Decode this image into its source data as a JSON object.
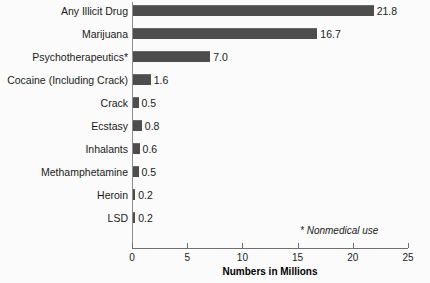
{
  "chart_data": {
    "type": "bar",
    "orientation": "horizontal",
    "title": "",
    "xlabel": "Numbers in Millions",
    "ylabel": "",
    "xlim": [
      0,
      25
    ],
    "xticks": [
      0,
      5,
      10,
      15,
      20,
      25
    ],
    "xtick_labels": [
      "0",
      "5",
      "10",
      "15",
      "20",
      "25"
    ],
    "grid": false,
    "legend": null,
    "bar_color": "#4d4d4d",
    "axis_color": "#6f6f6f",
    "background_color": "#fbfbfb",
    "categories": [
      "Any Illicit Drug",
      "Marijuana",
      "Psychotherapeutics*",
      "Cocaine (Including Crack)",
      "Crack",
      "Ecstasy",
      "Inhalants",
      "Methamphetamine",
      "Heroin",
      "LSD"
    ],
    "values": [
      21.8,
      16.7,
      7.0,
      1.6,
      0.5,
      0.8,
      0.6,
      0.5,
      0.2,
      0.2
    ],
    "value_labels": [
      "21.8",
      "16.7",
      "7.0",
      "1.6",
      "0.5",
      "0.8",
      "0.6",
      "0.5",
      "0.2",
      "0.2"
    ],
    "annotations": [
      {
        "text": "* Nonmedical use",
        "style": "italic"
      }
    ]
  }
}
